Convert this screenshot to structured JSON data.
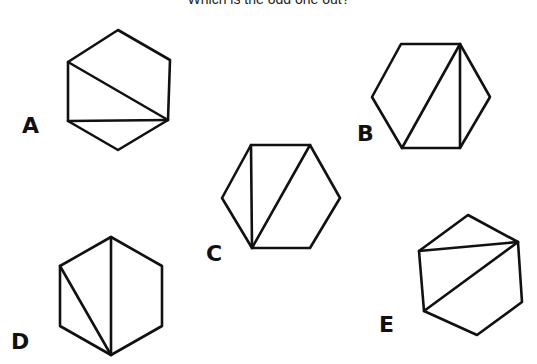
{
  "title": "Which is the odd one out?",
  "stroke_color": "#111111",
  "figures": [
    {
      "label": "A",
      "label_pos": [
        22,
        115
      ],
      "hexagon": [
        [
          118,
          30
        ],
        [
          170,
          60
        ],
        [
          168,
          120
        ],
        [
          118,
          150
        ],
        [
          68,
          121
        ],
        [
          68,
          62
        ]
      ],
      "diagonals": [
        [
          [
            68,
            62
          ],
          [
            168,
            120
          ]
        ],
        [
          [
            68,
            121
          ],
          [
            168,
            120
          ]
        ]
      ]
    },
    {
      "label": "B",
      "label_pos": [
        357,
        123
      ],
      "hexagon": [
        [
          401,
          44
        ],
        [
          460,
          44
        ],
        [
          490,
          97
        ],
        [
          460,
          148
        ],
        [
          402,
          148
        ],
        [
          372,
          97
        ]
      ],
      "diagonals": [
        [
          [
            460,
            44
          ],
          [
            402,
            148
          ]
        ],
        [
          [
            460,
            44
          ],
          [
            460,
            148
          ]
        ]
      ]
    },
    {
      "label": "C",
      "label_pos": [
        206,
        243
      ],
      "hexagon": [
        [
          251,
          145
        ],
        [
          310,
          145
        ],
        [
          340,
          198
        ],
        [
          310,
          248
        ],
        [
          252,
          248
        ],
        [
          222,
          198
        ]
      ],
      "diagonals": [
        [
          [
            251,
            145
          ],
          [
            252,
            248
          ]
        ],
        [
          [
            310,
            145
          ],
          [
            252,
            248
          ]
        ]
      ]
    },
    {
      "label": "D",
      "label_pos": [
        11,
        331
      ],
      "hexagon": [
        [
          111,
          237
        ],
        [
          162,
          266
        ],
        [
          162,
          326
        ],
        [
          111,
          355
        ],
        [
          60,
          326
        ],
        [
          60,
          266
        ]
      ],
      "diagonals": [
        [
          [
            111,
            237
          ],
          [
            111,
            355
          ]
        ],
        [
          [
            60,
            266
          ],
          [
            111,
            355
          ]
        ]
      ]
    },
    {
      "label": "E",
      "label_pos": [
        379,
        314
      ],
      "hexagon": [
        [
          468,
          215
        ],
        [
          518,
          242
        ],
        [
          522,
          302
        ],
        [
          477,
          335
        ],
        [
          424,
          311
        ],
        [
          419,
          251
        ]
      ],
      "diagonals": [
        [
          [
            419,
            251
          ],
          [
            518,
            242
          ]
        ],
        [
          [
            424,
            311
          ],
          [
            518,
            242
          ]
        ]
      ]
    }
  ]
}
